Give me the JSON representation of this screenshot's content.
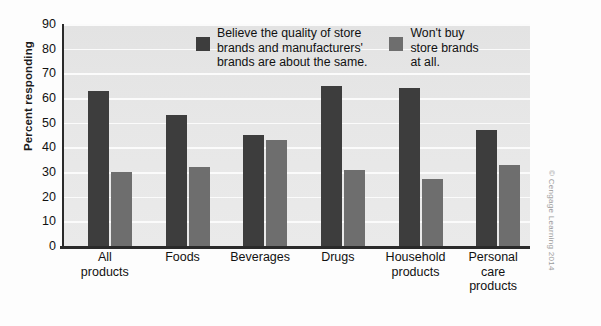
{
  "chart_data": {
    "type": "bar",
    "title": "",
    "xlabel": "",
    "ylabel": "Percent responding",
    "ylim": [
      0,
      90
    ],
    "ytick_step": 10,
    "yticks": [
      90,
      80,
      70,
      60,
      50,
      40,
      30,
      20,
      10,
      0
    ],
    "grid": true,
    "legend_position": "top-center",
    "categories": [
      "All\nproducts",
      "Foods",
      "Beverages",
      "Drugs",
      "Household\nproducts",
      "Personal\ncare\nproducts"
    ],
    "series": [
      {
        "name": "Believe the quality of store\nbrands and manufacturers'\nbrands are about the same.",
        "color": "#3d3d3d",
        "values": [
          63,
          53,
          45,
          65,
          64,
          47
        ]
      },
      {
        "name": "Won't buy\nstore brands\nat all.",
        "color": "#6e6e6e",
        "values": [
          30,
          32,
          43,
          31,
          27,
          33
        ]
      }
    ]
  },
  "credit": "© Cengage Learning 2014",
  "colors": {
    "series_dark": "#3d3d3d",
    "series_light": "#6e6e6e",
    "plot_background": "#e7e7e7",
    "gridline": "#fbfbfb",
    "axis": "#2a2a2a",
    "text": "#111111"
  }
}
